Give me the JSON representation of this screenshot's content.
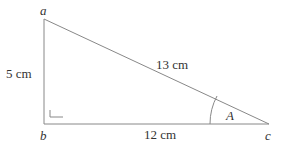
{
  "diagram": {
    "type": "right-triangle",
    "vertices": {
      "a": "a",
      "b": "b",
      "c": "c"
    },
    "sides": {
      "ab": "5 cm",
      "ac": "13 cm",
      "bc": "12 cm"
    },
    "angle_label": "A",
    "right_angle_at": "b",
    "line_color": "#888888",
    "text_color": "#333333"
  }
}
